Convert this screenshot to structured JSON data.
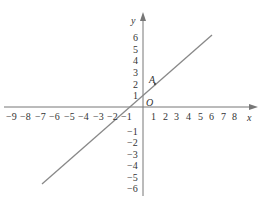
{
  "diagram": {
    "type": "coordinate-plane",
    "axes": {
      "x_label": "x",
      "y_label": "y",
      "origin_label": "O",
      "x_ticks_negative": [
        "−9",
        "−8",
        "−7",
        "−6",
        "−5",
        "−4",
        "−3",
        "−2",
        "−1"
      ],
      "x_ticks_positive": [
        "1",
        "2",
        "3",
        "4",
        "5",
        "6",
        "7",
        "8"
      ],
      "y_ticks_positive": [
        "1",
        "2",
        "3",
        "4",
        "5",
        "6"
      ],
      "y_ticks_negative": [
        "−1",
        "−2",
        "−3",
        "−4",
        "−5",
        "−6"
      ]
    },
    "line": {
      "description": "straight line y = x + 1",
      "color": "#888888"
    },
    "point": {
      "label": "A",
      "coords": [
        1,
        2
      ]
    }
  }
}
